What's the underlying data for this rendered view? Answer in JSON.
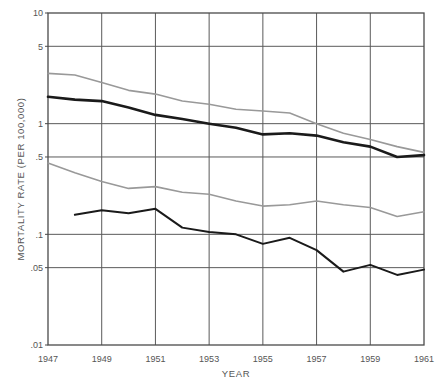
{
  "chart_data": {
    "type": "line",
    "title": "",
    "xlabel": "YEAR",
    "ylabel": "MORTALITY RATE (PER 100,000)",
    "yscale": "log",
    "ylim": [
      0.01,
      10
    ],
    "xlim": [
      1947,
      1961
    ],
    "grid": true,
    "legend": "none",
    "ytick_labels": [
      "10",
      "5",
      "1",
      ".5",
      ".1",
      ".05",
      ".01"
    ],
    "ytick_values": [
      10,
      5,
      1,
      0.5,
      0.1,
      0.05,
      0.01
    ],
    "xtick_labels": [
      "1947",
      "1949",
      "1951",
      "1953",
      "1955",
      "1957",
      "1959",
      "1961"
    ],
    "xtick_values": [
      1947,
      1949,
      1951,
      1953,
      1955,
      1957,
      1959,
      1961
    ],
    "x": [
      1947,
      1948,
      1949,
      1950,
      1951,
      1952,
      1953,
      1954,
      1955,
      1956,
      1957,
      1958,
      1959,
      1960,
      1961
    ],
    "series": [
      {
        "name": "upper-gray-line",
        "color": "#999999",
        "width": 1.6,
        "x": [
          1947,
          1948,
          1949,
          1950,
          1951,
          1952,
          1953,
          1954,
          1955,
          1956,
          1957,
          1958,
          1959,
          1960,
          1961
        ],
        "values": [
          2.85,
          2.75,
          2.35,
          2.0,
          1.85,
          1.6,
          1.5,
          1.35,
          1.3,
          1.25,
          1.0,
          0.82,
          0.72,
          0.62,
          0.55
        ]
      },
      {
        "name": "upper-black-line",
        "color": "#1a1a1a",
        "width": 2.6,
        "x": [
          1947,
          1948,
          1949,
          1950,
          1951,
          1952,
          1953,
          1954,
          1955,
          1956,
          1957,
          1958,
          1959,
          1960,
          1961
        ],
        "values": [
          1.75,
          1.65,
          1.6,
          1.4,
          1.2,
          1.1,
          1.0,
          0.92,
          0.8,
          0.82,
          0.78,
          0.68,
          0.62,
          0.5,
          0.52
        ]
      },
      {
        "name": "lower-gray-line",
        "color": "#999999",
        "width": 1.6,
        "x": [
          1947,
          1948,
          1949,
          1950,
          1951,
          1952,
          1953,
          1954,
          1955,
          1956,
          1957,
          1958,
          1959,
          1960,
          1961
        ],
        "values": [
          0.44,
          0.36,
          0.3,
          0.26,
          0.27,
          0.24,
          0.23,
          0.2,
          0.18,
          0.185,
          0.2,
          0.185,
          0.175,
          0.145,
          0.16
        ]
      },
      {
        "name": "lower-black-line",
        "color": "#1a1a1a",
        "width": 2.0,
        "x": [
          1948,
          1949,
          1950,
          1951,
          1952,
          1953,
          1954,
          1955,
          1956,
          1957,
          1958,
          1959,
          1960,
          1961
        ],
        "values": [
          0.15,
          0.165,
          0.155,
          0.17,
          0.115,
          0.105,
          0.1,
          0.082,
          0.093,
          0.072,
          0.046,
          0.053,
          0.043,
          0.048
        ]
      }
    ]
  },
  "axes": {
    "x_title": "YEAR",
    "y_title": "MORTALITY RATE (PER 100,000)"
  }
}
